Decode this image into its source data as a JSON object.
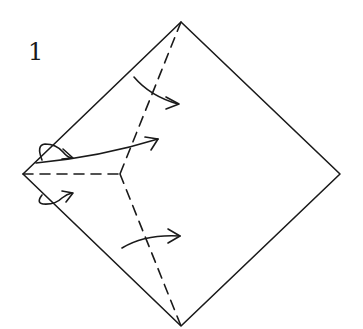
{
  "diagram": {
    "step_number": "1",
    "colors": {
      "line": "#1a1a1a",
      "background": "#ffffff"
    },
    "square": {
      "top": [
        181,
        22
      ],
      "right": [
        340,
        174
      ],
      "bottom": [
        181,
        326
      ],
      "left": [
        23,
        174
      ]
    },
    "junction": [
      120,
      174
    ],
    "fold_lines": [
      {
        "name": "upper-diagonal-fold",
        "from": [
          181,
          22
        ],
        "to": [
          120,
          174
        ],
        "style": "dashed"
      },
      {
        "name": "lower-diagonal-fold",
        "from": [
          120,
          174
        ],
        "to": [
          181,
          326
        ],
        "style": "dashed"
      },
      {
        "name": "horizontal-fold",
        "from": [
          23,
          174
        ],
        "to": [
          120,
          174
        ],
        "style": "dashed"
      }
    ],
    "arrows": [
      "upper-fold-arrow",
      "center-fold-arrow",
      "lower-fold-arrow",
      "upper-left-flap-arrow",
      "lower-left-flap-arrow"
    ]
  }
}
